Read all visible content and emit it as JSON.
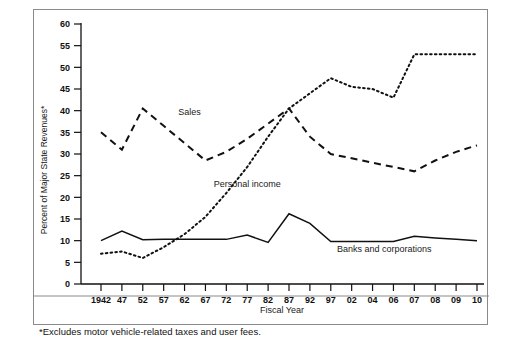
{
  "chart_data": {
    "type": "line",
    "title": "",
    "xlabel": "Fiscal Year",
    "ylabel": "Percent of Major State Revenues*",
    "footnote": "*Excludes motor vehicle-related taxes and user fees.",
    "categories": [
      "1942",
      "47",
      "52",
      "57",
      "62",
      "67",
      "72",
      "77",
      "82",
      "87",
      "92",
      "97",
      "02",
      "04",
      "06",
      "07",
      "08",
      "09",
      "10"
    ],
    "ylim": [
      0,
      60
    ],
    "yticks": [
      0,
      5,
      10,
      15,
      20,
      25,
      30,
      35,
      40,
      45,
      50,
      55,
      60
    ],
    "grid": false,
    "legend_position": "inline-annotations",
    "series": [
      {
        "name": "Sales",
        "style": "dashed",
        "color": "#111111",
        "label_x_index": 3.7,
        "label_y": 39.0,
        "values": [
          35.0,
          31.0,
          40.5,
          36.5,
          32.5,
          28.5,
          30.5,
          33.5,
          37.0,
          40.5,
          34.0,
          30.0,
          29.0,
          28.0,
          27.0,
          26.0,
          28.5,
          30.5,
          32.0
        ]
      },
      {
        "name": "Personal income",
        "style": "dotted",
        "color": "#111111",
        "label_x_index": 5.4,
        "label_y": 22.5,
        "values": [
          7.0,
          7.5,
          6.0,
          8.5,
          11.5,
          15.5,
          21.0,
          27.0,
          34.0,
          40.5,
          44.0,
          47.5,
          45.5,
          45.0,
          43.0,
          53.0,
          53.0,
          53.0,
          53.0
        ]
      },
      {
        "name": "Banks and corporations",
        "style": "solid",
        "color": "#111111",
        "label_x_index": 11.3,
        "label_y": 7.3,
        "values": [
          10.0,
          12.2,
          10.2,
          10.3,
          10.3,
          10.3,
          10.3,
          11.3,
          9.6,
          16.2,
          14.0,
          9.8,
          9.8,
          9.8,
          9.8,
          11.0,
          10.6,
          10.3,
          10.0
        ]
      }
    ]
  }
}
